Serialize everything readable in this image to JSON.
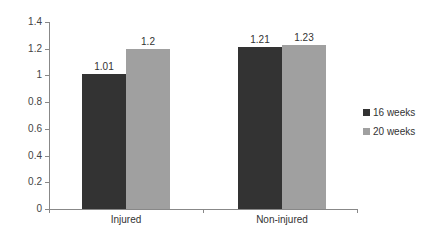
{
  "chart_data": {
    "type": "bar",
    "title": "",
    "xlabel": "",
    "ylabel": "",
    "categories": [
      "Injured",
      "Non-injured"
    ],
    "series": [
      {
        "name": "16 weeks",
        "values": [
          1.01,
          1.21
        ],
        "color": "#333333"
      },
      {
        "name": "20 weeks",
        "values": [
          1.2,
          1.23
        ],
        "color": "#a0a0a0"
      }
    ],
    "value_labels": [
      [
        "1.01",
        "1.21"
      ],
      [
        "1.2",
        "1.23"
      ]
    ],
    "ylim": [
      0,
      1.4
    ],
    "yticks": [
      "0",
      "0.2",
      "0.4",
      "0.6",
      "0.8",
      "1",
      "1.2",
      "1.4"
    ],
    "grid": false,
    "legend_position": "right"
  },
  "legend": {
    "items": [
      {
        "label": "16 weeks",
        "color": "#333333"
      },
      {
        "label": "20 weeks",
        "color": "#a0a0a0"
      }
    ]
  }
}
